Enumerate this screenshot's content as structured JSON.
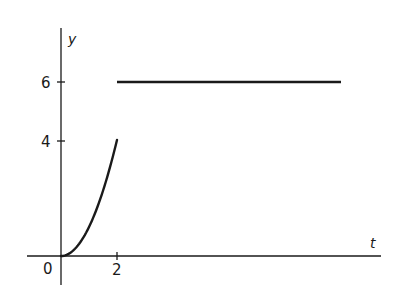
{
  "chart_data": {
    "type": "line",
    "title": "",
    "xlabel": "t",
    "ylabel": "y",
    "x_ticks": [
      "0",
      "2"
    ],
    "y_ticks": [
      "4",
      "6"
    ],
    "xlim": [
      -1.2,
      11.6
    ],
    "ylim": [
      -1,
      7.7
    ],
    "grid": false,
    "legend": null,
    "series": [
      {
        "name": "y = t^2 (0 ≤ t ≤ 2)",
        "x": [
          0,
          0.25,
          0.5,
          0.75,
          1.0,
          1.25,
          1.5,
          1.75,
          2.0
        ],
        "y": [
          0,
          0.0625,
          0.25,
          0.5625,
          1.0,
          1.5625,
          2.25,
          3.0625,
          4.0
        ]
      },
      {
        "name": "y = 6 (t > 2)",
        "x": [
          2,
          10
        ],
        "y": [
          6,
          6
        ]
      }
    ]
  },
  "labels": {
    "x_axis": "t",
    "y_axis": "y",
    "origin": "0",
    "tick_x_2": "2",
    "tick_y_4": "4",
    "tick_y_6": "6"
  },
  "colors": {
    "ink": "#1a1a1a",
    "background": "#ffffff"
  }
}
